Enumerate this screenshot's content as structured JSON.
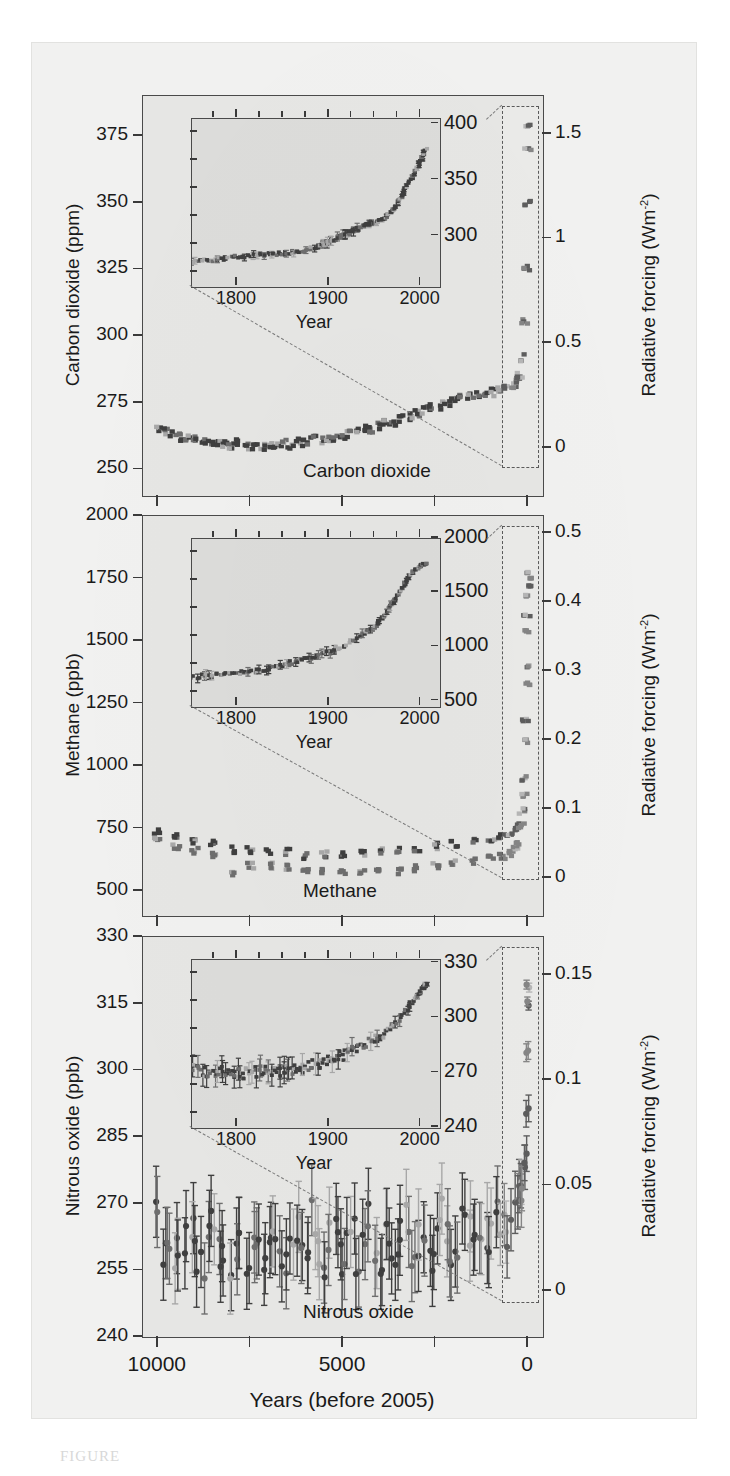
{
  "figure": {
    "caption_mark": "FIGURE",
    "background_color": "#f1f1f0",
    "plot_background_color": "#e6e6e4",
    "inset_background_color": "#dcdcda",
    "series_dark_color": "#3f3f3f",
    "series_mid_color": "#6e6e6e",
    "series_light_color": "#a8a8a8",
    "axis_color": "#4a4a4a"
  },
  "shared": {
    "xaxis_title": "Years (before 2005)",
    "xaxis_ticks": [
      "10000",
      "5000",
      "0"
    ],
    "xaxis_tick_values": [
      10000,
      5000,
      0
    ],
    "inset_xaxis_title": "Year",
    "inset_xaxis_ticks": [
      "1800",
      "1900",
      "2000"
    ],
    "inset_xaxis_tick_values": [
      1800,
      1900,
      2000
    ],
    "right_axis_title_prefix": "Radiative forcing (Wm",
    "right_axis_title_exponent": "-2",
    "right_axis_title_suffix": ")"
  },
  "panels": [
    {
      "key": "carbon-dioxide",
      "in_plot_title": "Carbon dioxide",
      "left_axis_title": "Carbon dioxide (ppm)",
      "left_ticks": [
        "375",
        "350",
        "325",
        "300",
        "275",
        "250"
      ],
      "left_tick_values": [
        375,
        350,
        325,
        300,
        275,
        250
      ],
      "left_axis_range": [
        240,
        390
      ],
      "right_ticks": [
        "1.5",
        "1",
        "0.5",
        "0"
      ],
      "right_tick_values": [
        1.5,
        1.0,
        0.5,
        0.0
      ],
      "inset_ticks": [
        "400",
        "350",
        "300"
      ],
      "inset_tick_values": [
        400,
        350,
        300
      ],
      "inset_yrange": [
        255,
        405
      ],
      "inset_xrange": [
        1750,
        2020
      ]
    },
    {
      "key": "methane",
      "in_plot_title": "Methane",
      "left_axis_title": "Methane (ppb)",
      "left_ticks": [
        "2000",
        "1750",
        "1500",
        "1250",
        "1000",
        "750",
        "500"
      ],
      "left_tick_values": [
        2000,
        1750,
        1500,
        1250,
        1000,
        750,
        500
      ],
      "left_axis_range": [
        400,
        2000
      ],
      "right_ticks": [
        "0.5",
        "0.4",
        "0.3",
        "0.2",
        "0.1",
        "0"
      ],
      "right_tick_values": [
        0.5,
        0.4,
        0.3,
        0.2,
        0.1,
        0.0
      ],
      "inset_ticks": [
        "2000",
        "1500",
        "1000",
        "500"
      ],
      "inset_tick_values": [
        2000,
        1500,
        1000,
        500
      ],
      "inset_yrange": [
        450,
        2000
      ],
      "inset_xrange": [
        1750,
        2020
      ]
    },
    {
      "key": "nitrous-oxide",
      "in_plot_title": "Nitrous oxide",
      "left_axis_title": "Nitrous oxide (ppb)",
      "left_ticks": [
        "330",
        "315",
        "300",
        "285",
        "270",
        "255",
        "240"
      ],
      "left_tick_values": [
        330,
        315,
        300,
        285,
        270,
        255,
        240
      ],
      "left_axis_range": [
        240,
        330
      ],
      "right_ticks": [
        "0.15",
        "0.1",
        "0.05",
        "0"
      ],
      "right_tick_values": [
        0.15,
        0.1,
        0.05,
        0.0
      ],
      "inset_ticks": [
        "330",
        "300",
        "270",
        "240"
      ],
      "inset_tick_values": [
        330,
        300,
        270,
        240
      ],
      "inset_yrange": [
        240,
        332
      ],
      "inset_xrange": [
        1750,
        2020
      ]
    }
  ],
  "chart_data": [
    {
      "type": "scatter",
      "title": "Carbon dioxide",
      "xlabel": "Years (before 2005)",
      "ylabel": "Carbon dioxide (ppm)",
      "y2label": "Radiative forcing (Wm-2)",
      "xlim": [
        10400,
        -400
      ],
      "ylim": [
        240,
        390
      ],
      "y2lim": [
        -0.23,
        1.68
      ],
      "grid": false,
      "legend": null,
      "x_reversed": true,
      "series": [
        {
          "name": "Ice core and modern CO2",
          "x": [
            10000,
            9800,
            9600,
            9400,
            9200,
            9000,
            8800,
            8600,
            8400,
            8200,
            8000,
            7800,
            7600,
            7400,
            7200,
            7000,
            6800,
            6600,
            6400,
            6200,
            6000,
            5800,
            5600,
            5400,
            5200,
            5000,
            4800,
            4600,
            4400,
            4200,
            4000,
            3800,
            3600,
            3400,
            3200,
            3000,
            2800,
            2600,
            2400,
            2200,
            2000,
            1800,
            1600,
            1400,
            1200,
            1000,
            800,
            600,
            400,
            300,
            250,
            205,
            155,
            105,
            55,
            25,
            5,
            0
          ],
          "y": [
            265,
            264,
            263,
            262,
            262,
            261,
            261,
            260,
            260,
            259,
            259,
            260,
            259,
            259,
            258,
            259,
            259,
            260,
            259,
            260,
            260,
            261,
            261,
            262,
            262,
            263,
            263,
            264,
            265,
            265,
            266,
            267,
            268,
            269,
            270,
            271,
            272,
            273,
            274,
            275,
            276,
            277,
            277,
            278,
            278,
            279,
            280,
            281,
            282,
            283,
            284,
            286,
            292,
            305,
            325,
            350,
            370,
            379
          ],
          "errors": [
            3,
            3,
            3,
            3,
            3,
            3,
            3,
            3,
            3,
            3,
            3,
            3,
            3,
            3,
            3,
            3,
            3,
            3,
            3,
            3,
            3,
            3,
            3,
            3,
            3,
            3,
            3,
            3,
            3,
            3,
            3,
            3,
            3,
            3,
            3,
            3,
            3,
            3,
            3,
            3,
            3,
            3,
            3,
            3,
            3,
            3,
            3,
            3,
            3,
            3,
            3,
            3,
            3,
            3,
            3,
            2,
            1,
            1
          ]
        }
      ],
      "inset": {
        "type": "scatter",
        "xlabel": "Year",
        "xlim": [
          1750,
          2020
        ],
        "ylim": [
          255,
          405
        ],
        "x": [
          1750,
          1770,
          1790,
          1810,
          1830,
          1850,
          1870,
          1890,
          1900,
          1910,
          1920,
          1930,
          1940,
          1950,
          1960,
          1970,
          1980,
          1990,
          2000,
          2005
        ],
        "y": [
          277,
          279,
          281,
          283,
          284,
          285,
          287,
          292,
          296,
          300,
          303,
          307,
          311,
          312,
          317,
          325,
          338,
          354,
          369,
          379
        ],
        "errors": [
          3,
          3,
          3,
          3,
          3,
          3,
          3,
          3,
          4,
          4,
          4,
          4,
          3,
          2,
          1,
          1,
          1,
          1,
          1,
          1
        ]
      }
    },
    {
      "type": "scatter",
      "title": "Methane",
      "xlabel": "Years (before 2005)",
      "ylabel": "Methane (ppb)",
      "y2label": "Radiative forcing (Wm-2)",
      "xlim": [
        10400,
        -400
      ],
      "ylim": [
        400,
        2000
      ],
      "y2lim": [
        -0.055,
        0.525
      ],
      "grid": false,
      "legend": null,
      "x_reversed": true,
      "series": [
        {
          "name": "Methane (ice core, upper band)",
          "x": [
            10000,
            9500,
            9000,
            8500,
            8000,
            7500,
            7000,
            6500,
            6000,
            5500,
            5000,
            4500,
            4000,
            3500,
            3000,
            2500,
            2000,
            1500,
            1000,
            700,
            500,
            350,
            250,
            180,
            120,
            80,
            50,
            25,
            10,
            0
          ],
          "y": [
            740,
            715,
            700,
            690,
            665,
            665,
            660,
            655,
            640,
            645,
            650,
            655,
            660,
            665,
            670,
            680,
            690,
            700,
            705,
            715,
            720,
            740,
            760,
            820,
            950,
            1180,
            1400,
            1600,
            1720,
            1774
          ],
          "errors": [
            25,
            25,
            25,
            25,
            25,
            25,
            25,
            25,
            25,
            25,
            25,
            25,
            25,
            25,
            25,
            25,
            25,
            25,
            25,
            25,
            20,
            20,
            20,
            20,
            20,
            15,
            12,
            10,
            8,
            5
          ]
        },
        {
          "name": "Methane (ice core, lower band)",
          "x": [
            10000,
            9500,
            9000,
            8500,
            8000,
            7500,
            7000,
            6500,
            6000,
            5500,
            5000,
            4500,
            4000,
            3500,
            3000,
            2500,
            2000,
            1500,
            1000,
            700,
            500,
            350,
            250,
            180,
            120,
            80,
            50,
            25,
            10,
            0
          ],
          "y": [
            700,
            680,
            660,
            640,
            575,
            600,
            600,
            595,
            580,
            575,
            570,
            570,
            575,
            580,
            590,
            600,
            610,
            620,
            630,
            640,
            650,
            670,
            690,
            760,
            880,
            1100,
            1330,
            1540,
            1680,
            1750
          ],
          "errors": [
            25,
            25,
            25,
            25,
            25,
            25,
            25,
            25,
            25,
            25,
            25,
            25,
            25,
            25,
            25,
            25,
            25,
            25,
            25,
            25,
            20,
            20,
            20,
            20,
            20,
            15,
            12,
            10,
            8,
            5
          ]
        }
      ],
      "inset": {
        "type": "scatter",
        "xlabel": "Year",
        "xlim": [
          1750,
          2020
        ],
        "ylim": [
          450,
          2000
        ],
        "x": [
          1750,
          1775,
          1800,
          1820,
          1840,
          1860,
          1880,
          1900,
          1920,
          1940,
          1950,
          1960,
          1970,
          1980,
          1990,
          2000,
          2005
        ],
        "y": [
          730,
          740,
          760,
          790,
          820,
          860,
          900,
          960,
          1040,
          1130,
          1200,
          1300,
          1430,
          1570,
          1700,
          1760,
          1774
        ],
        "errors": [
          40,
          40,
          40,
          40,
          40,
          40,
          40,
          40,
          40,
          40,
          30,
          25,
          20,
          15,
          10,
          8,
          8
        ]
      }
    },
    {
      "type": "scatter",
      "title": "Nitrous oxide",
      "xlabel": "Years (before 2005)",
      "ylabel": "Nitrous oxide (ppb)",
      "y2label": "Radiative forcing (Wm-2)",
      "xlim": [
        10400,
        -400
      ],
      "ylim": [
        240,
        330
      ],
      "y2lim": [
        -0.022,
        0.168
      ],
      "grid": false,
      "legend": null,
      "x_reversed": true,
      "series": [
        {
          "name": "Nitrous oxide (ice core + modern)",
          "x": [
            10000,
            9850,
            9700,
            9550,
            9400,
            9250,
            9100,
            8950,
            8800,
            8650,
            8500,
            8350,
            8200,
            8050,
            7900,
            7750,
            7600,
            7450,
            7300,
            7150,
            7000,
            6850,
            6700,
            6550,
            6400,
            6250,
            6100,
            5950,
            5800,
            5650,
            5500,
            5350,
            5200,
            5050,
            4900,
            4750,
            4600,
            4450,
            4300,
            4150,
            4000,
            3850,
            3700,
            3550,
            3400,
            3250,
            3100,
            2950,
            2800,
            2650,
            2500,
            2350,
            2200,
            2050,
            1900,
            1750,
            1600,
            1450,
            1300,
            1150,
            1000,
            850,
            700,
            550,
            400,
            300,
            220,
            160,
            110,
            70,
            45,
            25,
            10,
            0
          ],
          "y": [
            270,
            258,
            262,
            259,
            257,
            261,
            264,
            258,
            256,
            263,
            268,
            259,
            257,
            254,
            261,
            265,
            258,
            260,
            263,
            257,
            261,
            266,
            259,
            255,
            262,
            264,
            258,
            261,
            267,
            259,
            256,
            262,
            265,
            258,
            260,
            263,
            257,
            262,
            268,
            260,
            258,
            264,
            261,
            257,
            263,
            266,
            259,
            262,
            265,
            258,
            261,
            270,
            264,
            259,
            262,
            268,
            263,
            261,
            266,
            264,
            262,
            268,
            265,
            263,
            267,
            270,
            272,
            274,
            276,
            280,
            290,
            305,
            315,
            319
          ],
          "errors": [
            8,
            8,
            8,
            8,
            8,
            8,
            8,
            8,
            8,
            8,
            8,
            8,
            8,
            8,
            8,
            8,
            8,
            8,
            8,
            8,
            8,
            8,
            8,
            8,
            8,
            8,
            8,
            8,
            8,
            8,
            8,
            8,
            8,
            8,
            8,
            8,
            8,
            8,
            8,
            8,
            8,
            8,
            8,
            8,
            8,
            8,
            8,
            8,
            8,
            8,
            8,
            8,
            8,
            8,
            8,
            8,
            8,
            8,
            8,
            8,
            8,
            8,
            7,
            7,
            7,
            6,
            6,
            5,
            5,
            4,
            3,
            2,
            1,
            1
          ]
        }
      ],
      "inset": {
        "type": "scatter",
        "xlabel": "Year",
        "xlim": [
          1750,
          2020
        ],
        "ylim": [
          240,
          332
        ],
        "x": [
          1750,
          1765,
          1780,
          1795,
          1810,
          1825,
          1840,
          1855,
          1870,
          1885,
          1900,
          1915,
          1930,
          1945,
          1960,
          1975,
          1990,
          2000,
          2005
        ],
        "y": [
          272,
          271,
          271,
          270,
          270,
          271,
          271,
          272,
          273,
          275,
          277,
          280,
          284,
          288,
          292,
          299,
          309,
          316,
          319
        ],
        "errors": [
          6,
          6,
          6,
          6,
          6,
          6,
          6,
          6,
          6,
          6,
          6,
          5,
          5,
          5,
          4,
          3,
          2,
          1,
          1
        ]
      }
    }
  ]
}
